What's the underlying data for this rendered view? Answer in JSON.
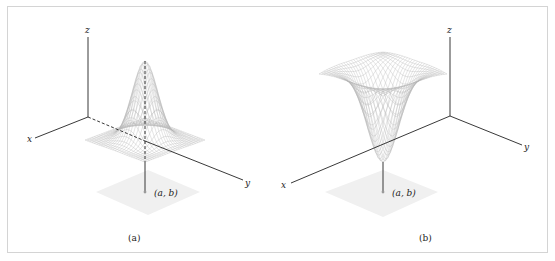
{
  "figure": {
    "panels": [
      {
        "id": "a",
        "caption": "(a)",
        "description": "Surface with a local maximum (peak) above the point (a, b)",
        "surface_type": "peak",
        "axes": {
          "x_label": "x",
          "y_label": "y",
          "z_label": "z"
        },
        "point_label": "(a, b)",
        "vertical_line": "dashed from peak to base, solid to point"
      },
      {
        "id": "b",
        "caption": "(b)",
        "description": "Surface with a local minimum (trough) above the point (a, b)",
        "surface_type": "trough",
        "axes": {
          "x_label": "x",
          "y_label": "y",
          "z_label": "z"
        },
        "point_label": "(a, b)",
        "vertical_line": "solid from surface tip to point"
      }
    ],
    "colors": {
      "axis": "#222222",
      "mesh": "#b8b8b8",
      "shadow": "#efefef",
      "border": "#d4d4d4",
      "point": "#9a9a9a"
    }
  }
}
